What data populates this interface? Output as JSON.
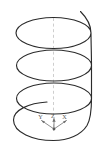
{
  "figure": {
    "background_color": "#ffffff",
    "curve_color": "#2b2b2b",
    "axis_color": "#6f6f6f",
    "guide_color": "#b9b9b9",
    "width": 112,
    "height": 150
  },
  "helix": {
    "name": "helix-curve",
    "turns": 3,
    "center_x": 53.5,
    "radius_x": 38,
    "radius_y": 13.5,
    "top_y": 11,
    "bottom_y": 140,
    "pitch": 36
  },
  "center_axis": {
    "name": "center-axis-dashed-line",
    "x": 53.5,
    "y_top": 18,
    "y_bottom": 131,
    "style": "dashed"
  },
  "coordinate_frame": {
    "origin_x": 54,
    "origin_y": 129,
    "axes": [
      {
        "id": "y-axis",
        "label": "Y",
        "label_x": 40.5,
        "label_y": 118.5,
        "tip_x": 41.5,
        "tip_y": 120.5
      },
      {
        "id": "z-axis",
        "label": "Z",
        "label_x": 53.0,
        "label_y": 117.5,
        "tip_x": 54.0,
        "tip_y": 118.5
      },
      {
        "id": "x-axis",
        "label": "X",
        "label_x": 64.5,
        "label_y": 118.5,
        "tip_x": 66.5,
        "tip_y": 120.5
      }
    ]
  }
}
